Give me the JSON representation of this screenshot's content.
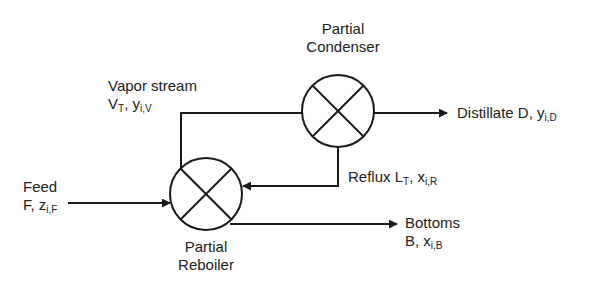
{
  "units": {
    "condenser": {
      "line1": "Partial",
      "line2": "Condenser"
    },
    "reboiler": {
      "line1": "Partial",
      "line2": "Reboiler"
    }
  },
  "streams": {
    "vapor": {
      "name": "Vapor stream",
      "sym": "V",
      "sym_sub": "T",
      "comp": "y",
      "comp_sub": "i,V"
    },
    "distillate": {
      "name": "Distillate D, ",
      "comp": "y",
      "comp_sub": "i,D"
    },
    "reflux": {
      "name": "Reflux L",
      "sym_sub": "T",
      "comp": "x",
      "comp_sub": "i,R"
    },
    "feed": {
      "name": "Feed",
      "sym": "F, ",
      "comp": "z",
      "comp_sub": "i,F"
    },
    "bottoms": {
      "name": "Bottoms",
      "sym": "B, ",
      "comp": "x",
      "comp_sub": "i,B"
    }
  },
  "colors": {
    "line": "#1a1a1a",
    "text": "#222222",
    "background": "#ffffff"
  }
}
